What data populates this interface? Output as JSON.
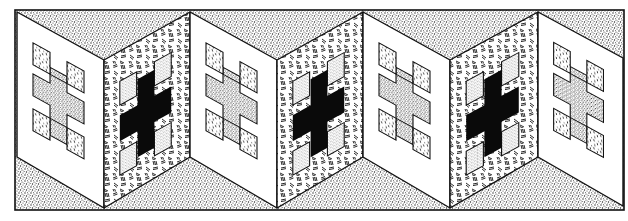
{
  "illustration": {
    "title": "Folding screen with cross motifs",
    "width": 628,
    "height": 221,
    "frame": {
      "x": 15,
      "y": 10,
      "width": 609,
      "height": 200
    },
    "colors": {
      "paper": "#ffffff",
      "ink": "#111111",
      "stipple_bg": "#bdbdbd"
    },
    "folds": [
      {
        "x": 17,
        "top": 12,
        "bottom": 157
      },
      {
        "x": 104,
        "top": 60,
        "bottom": 208
      },
      {
        "x": 190,
        "top": 12,
        "bottom": 157
      },
      {
        "x": 277,
        "top": 60,
        "bottom": 208
      },
      {
        "x": 363,
        "top": 12,
        "bottom": 157
      },
      {
        "x": 450,
        "top": 60,
        "bottom": 208
      },
      {
        "x": 538,
        "top": 12,
        "bottom": 157
      },
      {
        "x": 623,
        "top": 58,
        "bottom": 206
      }
    ],
    "panels": [
      {
        "index": 1,
        "style": "white",
        "motif": "stippled-cross-with-dashed-squares"
      },
      {
        "index": 2,
        "style": "hatched",
        "motif": "black-cross-with-stipple-squares"
      },
      {
        "index": 3,
        "style": "white",
        "motif": "stippled-cross-with-dashed-squares"
      },
      {
        "index": 4,
        "style": "hatched",
        "motif": "black-cross-with-stipple-squares"
      },
      {
        "index": 5,
        "style": "white",
        "motif": "stippled-cross-with-dashed-squares"
      },
      {
        "index": 6,
        "style": "hatched",
        "motif": "black-cross-with-stipple-squares"
      },
      {
        "index": 7,
        "style": "white",
        "motif": "stippled-cross-with-dashed-squares"
      }
    ]
  }
}
